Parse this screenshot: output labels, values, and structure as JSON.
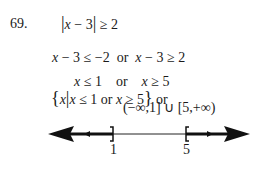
{
  "problem": {
    "number": "69.",
    "lines": [
      {
        "id": "inequality",
        "parts": [
          "|",
          "x",
          " − 3",
          "|",
          " ≥ 2"
        ]
      },
      {
        "id": "split",
        "parts": [
          "x",
          " − 3 ≤ −2  or  ",
          "x",
          " − 3 ≥ 2"
        ]
      },
      {
        "id": "solved",
        "parts": [
          "x",
          " ≤ 1    or    ",
          "x",
          " ≥ 5"
        ]
      },
      {
        "id": "set-notation",
        "parts": [
          "{",
          "x",
          "|",
          "x",
          " ≤ 1 or ",
          "x",
          " ≥ 5",
          "}",
          " or"
        ]
      }
    ],
    "interval_notation": "(−∞,1] ∪ [5,+∞)"
  },
  "number_line": {
    "left_endpoint": {
      "value": "1",
      "bracket": "]"
    },
    "right_endpoint": {
      "value": "5",
      "bracket": "["
    },
    "shaded": [
      "(-∞, 1]",
      "[5, +∞)"
    ]
  }
}
